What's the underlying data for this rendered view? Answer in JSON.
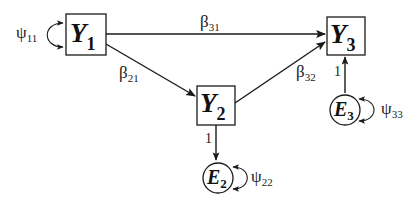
{
  "diagram": {
    "type": "path-diagram",
    "colors": {
      "stroke": "#1a1a1a",
      "text": "#111111",
      "background": "#ffffff"
    },
    "nodes": {
      "Y1": {
        "label": "Y",
        "subscript": "1",
        "shape": "box"
      },
      "Y2": {
        "label": "Y",
        "subscript": "2",
        "shape": "box"
      },
      "Y3": {
        "label": "Y",
        "subscript": "3",
        "shape": "box"
      },
      "E2": {
        "label": "E",
        "subscript": "2",
        "shape": "circle"
      },
      "E3": {
        "label": "E",
        "subscript": "3",
        "shape": "circle"
      }
    },
    "paths": {
      "b31": {
        "from": "Y1",
        "to": "Y3",
        "symbol": "β",
        "subscript": "31"
      },
      "b21": {
        "from": "Y1",
        "to": "Y2",
        "symbol": "β",
        "subscript": "21"
      },
      "b32": {
        "from": "Y2",
        "to": "Y3",
        "symbol": "β",
        "subscript": "32"
      },
      "e2": {
        "from": "E2",
        "to": "Y2",
        "fixed": "1"
      },
      "e3": {
        "from": "E3",
        "to": "Y3",
        "fixed": "1"
      }
    },
    "variances": {
      "psi11": {
        "node": "Y1",
        "symbol": "ψ",
        "subscript": "11"
      },
      "psi22": {
        "node": "E2",
        "symbol": "ψ",
        "subscript": "22"
      },
      "psi33": {
        "node": "E3",
        "symbol": "ψ",
        "subscript": "33"
      }
    }
  }
}
